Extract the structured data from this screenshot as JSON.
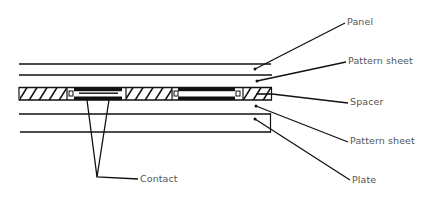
{
  "diagram": {
    "line_color": "#111111",
    "label_color": "#555555",
    "labels": [
      {
        "id": "panel",
        "text": "Panel",
        "x": 347,
        "y": 17
      },
      {
        "id": "pattern-sheet-top",
        "text": "Pattern sheet",
        "x": 348,
        "y": 56
      },
      {
        "id": "spacer",
        "text": "Spacer",
        "x": 350,
        "y": 97
      },
      {
        "id": "pattern-sheet-bottom",
        "text": "Pattern sheet",
        "x": 350,
        "y": 136
      },
      {
        "id": "plate",
        "text": "Plate",
        "x": 352,
        "y": 175
      },
      {
        "id": "contact",
        "text": "Contact",
        "x": 140,
        "y": 174
      }
    ]
  }
}
